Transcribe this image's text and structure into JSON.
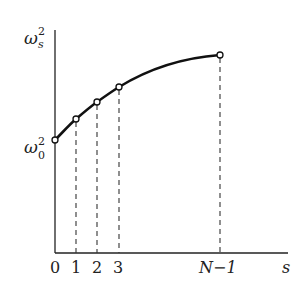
{
  "diagram": {
    "y_axis_label": {
      "base": "ω",
      "sub": "s",
      "sup": "2"
    },
    "y_origin_label": {
      "base": "ω",
      "sub": "0",
      "sup": "2"
    },
    "x_axis_label": "s",
    "x_ticks": [
      "0",
      "1",
      "2",
      "3",
      "N−1"
    ],
    "points": [
      {
        "label": "0",
        "x": 55,
        "y": 140
      },
      {
        "label": "1",
        "x": 76,
        "y": 119
      },
      {
        "label": "2",
        "x": 97,
        "y": 102
      },
      {
        "label": "3",
        "x": 119,
        "y": 87
      },
      {
        "label": "N−1",
        "x": 220,
        "y": 55
      }
    ],
    "colors": {
      "line": "#111111",
      "axis": "#222222",
      "dash": "#333333"
    }
  }
}
